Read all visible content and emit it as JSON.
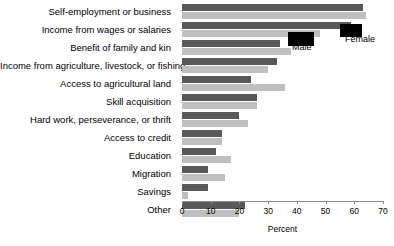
{
  "chart_data": {
    "type": "bar",
    "orientation": "horizontal",
    "title": "",
    "xlabel": "Percent",
    "ylabel": "",
    "xlim": [
      0,
      70
    ],
    "xticks": [
      0,
      10,
      20,
      30,
      40,
      50,
      60,
      70
    ],
    "grid": false,
    "legend_position": "inline-callout",
    "categories": [
      "Self-employment or business",
      "Income from wages or salaries",
      "Benefit of family and kin",
      "Income from agriculture, livestock, or fishing",
      "Access to agricultural land",
      "Skill acquisition",
      "Hard work, perseverance, or thrift",
      "Access to credit",
      "Education",
      "Migration",
      "Savings",
      "Other"
    ],
    "series": [
      {
        "name": "Male",
        "color": "#595959",
        "values": [
          63,
          59,
          34,
          33,
          24,
          26,
          20,
          14,
          12,
          9,
          9,
          22
        ]
      },
      {
        "name": "Female",
        "color": "#bfbfbf",
        "values": [
          64,
          48,
          38,
          30,
          36,
          26,
          23,
          14,
          17,
          15,
          2,
          20
        ]
      }
    ]
  },
  "legend": {
    "male_label": "Male",
    "female_label": "Female"
  },
  "axis": {
    "title": "Percent",
    "tick_labels": [
      "0",
      "10",
      "20",
      "30",
      "40",
      "50",
      "60",
      "70"
    ]
  },
  "colors": {
    "male": "#595959",
    "female": "#bfbfbf",
    "axis": "#8c8c8c",
    "text": "#000000",
    "background": "#ffffff"
  }
}
